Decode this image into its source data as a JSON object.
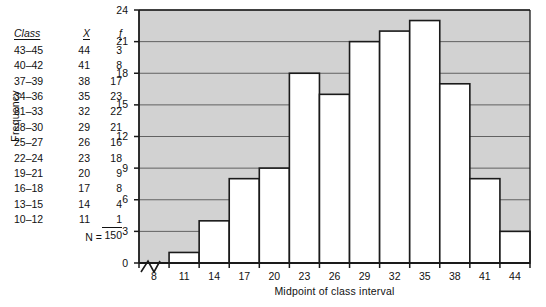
{
  "table": {
    "headers": [
      "Class",
      "X",
      "f"
    ],
    "rows": [
      {
        "cls": "43–45",
        "x": "44",
        "f": "3"
      },
      {
        "cls": "40–42",
        "x": "41",
        "f": "8"
      },
      {
        "cls": "37–39",
        "x": "38",
        "f": "17"
      },
      {
        "cls": "34–36",
        "x": "35",
        "f": "23"
      },
      {
        "cls": "31–33",
        "x": "32",
        "f": "22"
      },
      {
        "cls": "28–30",
        "x": "29",
        "f": "21"
      },
      {
        "cls": "25–27",
        "x": "26",
        "f": "16"
      },
      {
        "cls": "22–24",
        "x": "23",
        "f": "18"
      },
      {
        "cls": "19–21",
        "x": "20",
        "f": "9"
      },
      {
        "cls": "16–18",
        "x": "17",
        "f": "8"
      },
      {
        "cls": "13–15",
        "x": "14",
        "f": "4"
      },
      {
        "cls": "10–12",
        "x": "11",
        "f": "1"
      }
    ],
    "total_label": "N =",
    "total_value": "150"
  },
  "chart_data": {
    "type": "bar",
    "title": "",
    "xlabel": "Midpoint of class interval",
    "ylabel": "Frequency",
    "categories": [
      "8",
      "11",
      "14",
      "17",
      "20",
      "23",
      "26",
      "29",
      "32",
      "35",
      "38",
      "41",
      "44"
    ],
    "values": [
      0,
      1,
      4,
      8,
      9,
      18,
      16,
      21,
      22,
      23,
      17,
      8,
      3
    ],
    "xticks": [
      "8",
      "11",
      "14",
      "17",
      "20",
      "23",
      "26",
      "29",
      "32",
      "35",
      "38",
      "41",
      "44"
    ],
    "yticks": [
      "0",
      "3",
      "6",
      "9",
      "12",
      "15",
      "18",
      "21",
      "24"
    ],
    "ylim": [
      0,
      24
    ],
    "grid": true,
    "legend": false,
    "axis_break": true,
    "colors": {
      "plot_background": "#d2d2d2",
      "bar_fill": "#ffffff",
      "bar_stroke": "#1a1a1a",
      "gridline": "#555555",
      "axis": "#1a1a1a"
    }
  }
}
